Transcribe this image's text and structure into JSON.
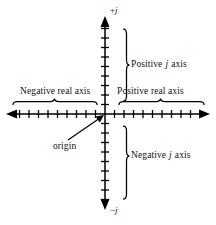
{
  "figure": {
    "background_color": "#ffffff",
    "ink_color": "#000000"
  },
  "axes": {
    "origin": {
      "x": 105,
      "y": 114
    },
    "horizontal": {
      "name": "real-axis",
      "x_start": 8,
      "x_end": 208,
      "tick_spacing": 9.5,
      "ticks_left": 10,
      "ticks_right": 10,
      "tick_half_height": 4,
      "arrow_both_ends": true
    },
    "vertical": {
      "name": "imaginary-axis",
      "y_start": 18,
      "y_end": 208,
      "tick_spacing": 9.5,
      "ticks_up": 9,
      "ticks_down": 9,
      "tick_half_width": 4,
      "arrow_both_ends": true
    }
  },
  "endpoint_labels": {
    "top": {
      "sign": "+",
      "symbol": "j"
    },
    "bottom": {
      "sign": "−",
      "symbol": "j"
    }
  },
  "labels": {
    "positive_j_axis": {
      "prefix": "Positive",
      "symbol": "j",
      "suffix": "axis"
    },
    "negative_j_axis": {
      "prefix": "Negative",
      "symbol": "j",
      "suffix": "axis"
    },
    "positive_real_axis": "Positive real axis",
    "negative_real_axis": "Negative real axis",
    "origin": "origin"
  },
  "braces": {
    "positive_j": {
      "orientation": "vertical",
      "x": 124,
      "y_top": 29,
      "y_bottom": 101,
      "tip_x": 130,
      "tip_y": 65
    },
    "negative_j": {
      "orientation": "vertical",
      "x": 124,
      "y_top": 126,
      "y_bottom": 199,
      "tip_x": 130,
      "tip_y": 156
    },
    "positive_real": {
      "orientation": "horizontal",
      "y": 104,
      "x_left": 119,
      "x_right": 204,
      "tip_x": 161,
      "tip_y": 98
    },
    "negative_real": {
      "orientation": "horizontal",
      "y": 104,
      "x_left": 13,
      "x_right": 97,
      "tip_x": 55,
      "tip_y": 98
    }
  },
  "origin_pointer": {
    "name": "origin-arrow",
    "from": {
      "x": 68,
      "y": 140
    },
    "to": {
      "x": 103,
      "y": 116
    }
  }
}
